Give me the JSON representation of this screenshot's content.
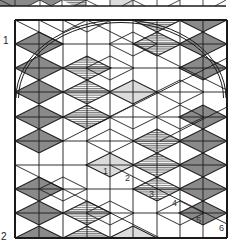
{
  "figure": {
    "title": "",
    "width": 241,
    "height": 252,
    "colors": {
      "line": "#1a1a1a",
      "gray_fill": "#8a8a8a",
      "light_fill": "#dcdcdc",
      "hatch_line": "#555555",
      "background": "#ffffff"
    },
    "panel_labels": [
      {
        "text": "1",
        "x": 3,
        "y": 44
      },
      {
        "text": "2",
        "x": 1,
        "y": 240
      }
    ],
    "top_strip": {
      "y_top": -6,
      "y_bottom": 6,
      "x_left": 0,
      "x_right": 226,
      "verticals": [
        15,
        40,
        62,
        86,
        110,
        133,
        157,
        180,
        203
      ],
      "fills": [
        {
          "type": "gray",
          "points": "0,0 40,0 28,6 0,6"
        },
        {
          "type": "gray",
          "points": "40,0 62,0 51,6"
        },
        {
          "type": "hatched",
          "points": "62,0 86,0 86,6 74,6"
        },
        {
          "type": "light",
          "points": "110,0 133,0 133,6 110,6"
        }
      ],
      "diagonals": [
        [
          0,
          0,
          12,
          6
        ],
        [
          28,
          6,
          40,
          0
        ],
        [
          40,
          0,
          51,
          6
        ],
        [
          51,
          6,
          62,
          0
        ],
        [
          74,
          6,
          86,
          0
        ],
        [
          86,
          0,
          98,
          6
        ],
        [
          122,
          6,
          133,
          0
        ],
        [
          133,
          0,
          145,
          6
        ],
        [
          168,
          6,
          180,
          0
        ],
        [
          215,
          6,
          226,
          0
        ]
      ]
    },
    "main_grid": {
      "x": [
        15,
        39,
        63,
        87,
        110,
        133,
        157,
        180,
        203,
        227
      ],
      "y": [
        20,
        44,
        68,
        92,
        117,
        141,
        165,
        189,
        213,
        238
      ],
      "diamond_half_width": 24,
      "diamond_half_height": 12
    },
    "diamonds": [
      {
        "cx": 157,
        "cy": 20,
        "type": "hatched"
      },
      {
        "cx": 203,
        "cy": 20,
        "type": "gray"
      },
      {
        "cx": 39,
        "cy": 44,
        "type": "gray"
      },
      {
        "cx": 157,
        "cy": 44,
        "type": "hatched"
      },
      {
        "cx": 203,
        "cy": 44,
        "type": "gray"
      },
      {
        "cx": 39,
        "cy": 68,
        "type": "gray"
      },
      {
        "cx": 87,
        "cy": 68,
        "type": "hatched"
      },
      {
        "cx": 203,
        "cy": 68,
        "type": "gray"
      },
      {
        "cx": 39,
        "cy": 92,
        "type": "gray"
      },
      {
        "cx": 87,
        "cy": 92,
        "type": "hatched"
      },
      {
        "cx": 133,
        "cy": 92,
        "type": "light"
      },
      {
        "cx": 39,
        "cy": 117,
        "type": "gray"
      },
      {
        "cx": 87,
        "cy": 117,
        "type": "hatched"
      },
      {
        "cx": 203,
        "cy": 117,
        "type": "gray"
      },
      {
        "cx": 39,
        "cy": 141,
        "type": "gray"
      },
      {
        "cx": 157,
        "cy": 141,
        "type": "hatched"
      },
      {
        "cx": 203,
        "cy": 141,
        "type": "gray"
      },
      {
        "cx": 110,
        "cy": 165,
        "type": "light"
      },
      {
        "cx": 157,
        "cy": 165,
        "type": "hatched"
      },
      {
        "cx": 203,
        "cy": 165,
        "type": "gray"
      },
      {
        "cx": 39,
        "cy": 189,
        "type": "gray"
      },
      {
        "cx": 157,
        "cy": 189,
        "type": "hatched"
      },
      {
        "cx": 203,
        "cy": 189,
        "type": "gray"
      },
      {
        "cx": 39,
        "cy": 213,
        "type": "gray"
      },
      {
        "cx": 87,
        "cy": 213,
        "type": "hatched"
      },
      {
        "cx": 203,
        "cy": 213,
        "type": "gray"
      },
      {
        "cx": 39,
        "cy": 238,
        "type": "gray"
      },
      {
        "cx": 87,
        "cy": 238,
        "type": "hatched"
      },
      {
        "cx": 133,
        "cy": 238,
        "type": "light"
      }
    ],
    "outline_diamonds": [
      {
        "cx": 87,
        "cy": 20
      },
      {
        "cx": 133,
        "cy": 44
      },
      {
        "cx": 180,
        "cy": 92
      },
      {
        "cx": 63,
        "cy": 20
      },
      {
        "cx": 110,
        "cy": 68
      },
      {
        "cx": 133,
        "cy": 117
      },
      {
        "cx": 180,
        "cy": 117
      },
      {
        "cx": 110,
        "cy": 141
      },
      {
        "cx": 63,
        "cy": 189
      },
      {
        "cx": 110,
        "cy": 213
      },
      {
        "cx": 180,
        "cy": 213
      }
    ],
    "long_diagonals": [
      [
        15,
        20,
        63,
        44
      ],
      [
        87,
        20,
        227,
        90
      ],
      [
        63,
        141,
        110,
        117
      ],
      [
        110,
        117,
        227,
        58
      ],
      [
        110,
        165,
        227,
        224
      ],
      [
        63,
        189,
        160,
        238
      ],
      [
        15,
        165,
        63,
        189
      ],
      [
        160,
        141,
        227,
        107
      ]
    ],
    "arc": {
      "cx": 121,
      "cy": 98,
      "rx": 105,
      "ry": 78,
      "start_deg": 180,
      "end_deg": 360,
      "gap": 2.5
    },
    "number_labels": [
      {
        "text": "1",
        "x": 103,
        "y": 174
      },
      {
        "text": "2",
        "x": 125,
        "y": 181
      },
      {
        "text": "3",
        "x": 149,
        "y": 197
      },
      {
        "text": "4",
        "x": 172,
        "y": 206
      },
      {
        "text": "5",
        "x": 196,
        "y": 223
      },
      {
        "text": "6",
        "x": 219,
        "y": 231
      }
    ]
  }
}
